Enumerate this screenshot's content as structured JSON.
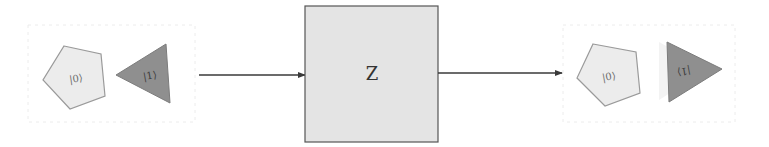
{
  "diagram": {
    "input_state": {
      "label": "input-qubit-states",
      "shapes": [
        {
          "kind": "pentagon",
          "ket": "|0⟩"
        },
        {
          "kind": "triangle",
          "orientation": "left",
          "ket": "|1⟩"
        }
      ]
    },
    "gate": {
      "label": "Z"
    },
    "output_state": {
      "label": "output-qubit-states",
      "shapes": [
        {
          "kind": "pentagon",
          "ket": "|0⟩"
        },
        {
          "kind": "triangle",
          "orientation": "right",
          "ket": "|1⟩",
          "mirrored": true
        }
      ]
    },
    "colors": {
      "pentagon_fill": "#ececec",
      "triangle_fill": "#8f8f8f",
      "gate_fill": "#e4e4e4",
      "arrow": "#3a3a3a"
    }
  }
}
